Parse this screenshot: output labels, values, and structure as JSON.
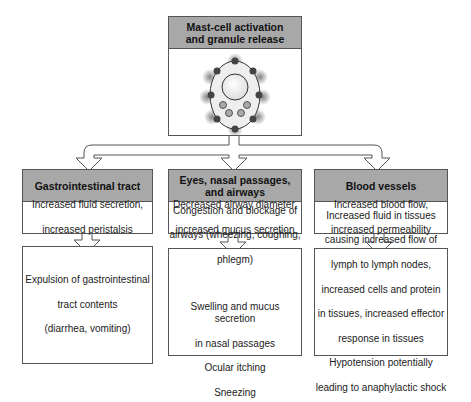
{
  "top": {
    "title_lines": [
      "Mast-cell activation",
      "and granule release"
    ],
    "illustration": "mast-cell-icon"
  },
  "columns": [
    {
      "title_lines": [
        "Gastrointestinal tract"
      ],
      "effect_lines": [
        "Increased fluid secretion,",
        "increased peristalsis"
      ],
      "outcome_lines": [
        "Expulsion of gastrointestinal",
        "tract contents",
        "(diarrhea, vomiting)"
      ]
    },
    {
      "title_lines": [
        "Eyes, nasal passages,",
        "and airways"
      ],
      "effect_lines": [
        "Decreased airway diameter,",
        "increased mucus secretion"
      ],
      "outcome_lines": [
        "Congestion and blockage of",
        "airways (wheezing, coughing,",
        "phlegm)",
        "",
        "Swelling and mucus secretion",
        "in nasal passages",
        "Ocular itching",
        "Sneezing"
      ]
    },
    {
      "title_lines": [
        "Blood vessels"
      ],
      "effect_lines": [
        "Increased blood flow,",
        "increased permeability"
      ],
      "outcome_lines": [
        "Increased fluid in tissues",
        "causing increased flow of",
        "lymph to lymph nodes,",
        "increased cells and protein",
        "in tissues, increased effector",
        "response in tissues",
        "Hypotension potentially",
        "leading to anaphylactic shock"
      ]
    }
  ],
  "colors": {
    "header_fill": "#a8a8a8",
    "border": "#555555",
    "granule": "#555555"
  }
}
